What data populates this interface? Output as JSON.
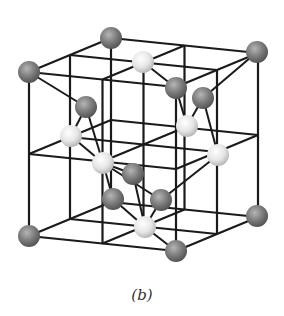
{
  "figure": {
    "caption": "(b)",
    "colors": {
      "line": "#1a1a1a",
      "dark_atom": "#7a7a7a",
      "light_atom": "#e8e8e8",
      "background": "#ffffff"
    },
    "corners": {
      "front_left_top": [
        29,
        72
      ],
      "front_right_top": [
        176,
        88
      ],
      "back_left_top": [
        111,
        38
      ],
      "back_right_top": [
        257,
        52
      ],
      "front_left_bottom": [
        29,
        236
      ],
      "front_right_bottom": [
        176,
        251
      ],
      "back_left_bottom": [
        111,
        202
      ],
      "back_right_bottom": [
        257,
        216
      ]
    },
    "dark_atoms": [
      [
        111,
        38
      ],
      [
        257,
        52
      ],
      [
        29,
        72
      ],
      [
        176,
        88
      ],
      [
        203,
        98
      ],
      [
        86,
        107
      ],
      [
        29,
        236
      ],
      [
        176,
        251
      ],
      [
        257,
        216
      ],
      [
        113,
        199
      ],
      [
        161,
        200
      ],
      [
        133,
        174
      ]
    ],
    "light_atoms": [
      [
        143,
        62
      ],
      [
        187,
        126
      ],
      [
        71,
        136
      ],
      [
        218,
        155
      ],
      [
        103,
        163
      ],
      [
        145,
        227
      ]
    ],
    "bonds": [
      [
        [
          29,
          72
        ],
        [
          86,
          107
        ]
      ],
      [
        [
          86,
          107
        ],
        [
          71,
          136
        ]
      ],
      [
        [
          86,
          107
        ],
        [
          103,
          163
        ]
      ],
      [
        [
          143,
          62
        ],
        [
          176,
          88
        ]
      ],
      [
        [
          176,
          88
        ],
        [
          187,
          126
        ]
      ],
      [
        [
          203,
          98
        ],
        [
          187,
          126
        ]
      ],
      [
        [
          203,
          98
        ],
        [
          218,
          155
        ]
      ],
      [
        [
          257,
          52
        ],
        [
          203,
          98
        ]
      ],
      [
        [
          103,
          163
        ],
        [
          161,
          200
        ]
      ],
      [
        [
          103,
          163
        ],
        [
          71,
          136
        ]
      ],
      [
        [
          103,
          163
        ],
        [
          113,
          199
        ]
      ],
      [
        [
          161,
          200
        ],
        [
          145,
          227
        ]
      ],
      [
        [
          161,
          200
        ],
        [
          218,
          155
        ]
      ],
      [
        [
          145,
          227
        ],
        [
          176,
          251
        ]
      ],
      [
        [
          145,
          227
        ],
        [
          113,
          199
        ]
      ],
      [
        [
          133,
          174
        ],
        [
          145,
          227
        ]
      ],
      [
        [
          133,
          174
        ],
        [
          103,
          163
        ]
      ]
    ]
  }
}
